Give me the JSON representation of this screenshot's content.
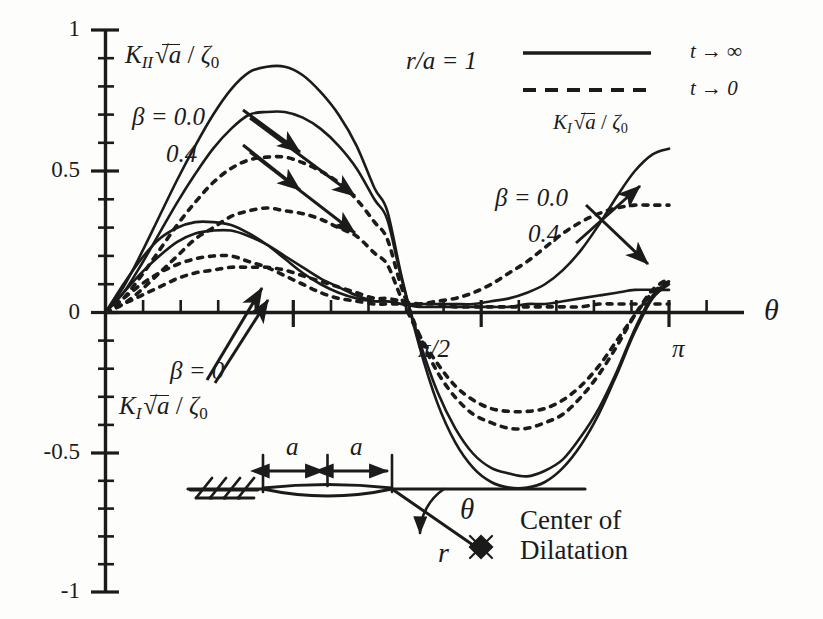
{
  "figure": {
    "background_color": "#fdfdfb",
    "ink_color": "#1b1b1b"
  },
  "axes": {
    "x": {
      "label": "θ",
      "tick_labels": [
        "π/2",
        "π"
      ],
      "tick_values": [
        1.5707963,
        3.1415927
      ],
      "range": [
        0,
        3.4
      ],
      "minor_ticks": true
    },
    "y": {
      "label": "",
      "tick_labels": [
        "1",
        "0.5",
        "0",
        "-0.5",
        "-1"
      ],
      "tick_values": [
        1,
        0.5,
        0,
        -0.5,
        -1
      ],
      "range": [
        -1,
        1
      ],
      "minor_ticks": true
    }
  },
  "annotations": {
    "kii_axis_label": {
      "k": "K",
      "k_sub": "II",
      "radicand": "a",
      "denom": "ζ",
      "denom_sub": "0"
    },
    "ki_axis_label": {
      "k": "K",
      "k_sub": "I",
      "radicand": "a",
      "denom": "ζ",
      "denom_sub": "0"
    },
    "ratio": "r/a = 1",
    "beta_upper_left": {
      "line1": "β = 0.0",
      "line2": "0.4"
    },
    "beta_right": {
      "line1": "β = 0.0",
      "line2": "0.4"
    },
    "beta_lower_left": "β = 0"
  },
  "legend": {
    "entries": [
      {
        "style": "solid",
        "label": "t → ∞"
      },
      {
        "style": "dashed",
        "label": "t → 0"
      }
    ],
    "caption": {
      "k": "K",
      "k_sub": "I",
      "radicand": "a",
      "denom": "ζ",
      "denom_sub": "0"
    }
  },
  "inset": {
    "dim_left_label": "a",
    "dim_right_label": "a",
    "angle_label": "θ",
    "radius_label": "r",
    "caption_line1": "Center of",
    "caption_line2": "Dilatation"
  },
  "chart_data": {
    "type": "line",
    "title": "",
    "xlabel": "θ",
    "ylabel": "K√a / ζ0",
    "xlim": [
      0,
      3.4
    ],
    "ylim": [
      -1,
      1
    ],
    "grid": false,
    "legend_position": "top-right",
    "x": [
      0.0,
      0.1,
      0.2,
      0.3,
      0.4,
      0.5,
      0.6,
      0.7,
      0.8,
      0.9,
      1.0,
      1.1,
      1.2,
      1.3,
      1.4,
      1.5,
      1.5708,
      1.65,
      1.75,
      1.85,
      1.95,
      2.05,
      2.15,
      2.25,
      2.35,
      2.45,
      2.55,
      2.65,
      2.75,
      2.85,
      2.95,
      3.05,
      3.1416
    ],
    "series": [
      {
        "name": "KII, t->inf, beta=0.0",
        "style": "solid",
        "quantity": "KII",
        "values": [
          0.0,
          0.09,
          0.21,
          0.34,
          0.47,
          0.59,
          0.7,
          0.79,
          0.85,
          0.87,
          0.87,
          0.84,
          0.78,
          0.7,
          0.59,
          0.44,
          0.36,
          0.13,
          -0.12,
          -0.32,
          -0.46,
          -0.55,
          -0.6,
          -0.62,
          -0.62,
          -0.6,
          -0.55,
          -0.47,
          -0.36,
          -0.22,
          -0.07,
          0.05,
          0.1
        ]
      },
      {
        "name": "KII, t->inf, beta=0.4",
        "style": "solid",
        "quantity": "KII",
        "values": [
          0.0,
          0.07,
          0.17,
          0.28,
          0.39,
          0.49,
          0.58,
          0.65,
          0.7,
          0.71,
          0.71,
          0.69,
          0.65,
          0.59,
          0.51,
          0.4,
          0.33,
          0.12,
          -0.1,
          -0.28,
          -0.41,
          -0.5,
          -0.55,
          -0.57,
          -0.58,
          -0.56,
          -0.52,
          -0.44,
          -0.34,
          -0.21,
          -0.06,
          0.06,
          0.11
        ]
      },
      {
        "name": "KII, t->0, beta=0.0",
        "style": "dashed",
        "quantity": "KII",
        "values": [
          0.0,
          0.05,
          0.13,
          0.22,
          0.31,
          0.39,
          0.46,
          0.51,
          0.54,
          0.55,
          0.55,
          0.53,
          0.5,
          0.46,
          0.4,
          0.32,
          0.26,
          0.09,
          -0.08,
          -0.21,
          -0.3,
          -0.36,
          -0.39,
          -0.41,
          -0.41,
          -0.39,
          -0.36,
          -0.3,
          -0.22,
          -0.12,
          -0.01,
          0.08,
          0.12
        ]
      },
      {
        "name": "KII, t->0, beta=0.4",
        "style": "dashed",
        "quantity": "KII",
        "values": [
          0.0,
          0.03,
          0.08,
          0.14,
          0.2,
          0.26,
          0.3,
          0.34,
          0.36,
          0.37,
          0.36,
          0.35,
          0.33,
          0.3,
          0.27,
          0.21,
          0.17,
          0.05,
          -0.08,
          -0.18,
          -0.26,
          -0.31,
          -0.34,
          -0.35,
          -0.35,
          -0.34,
          -0.31,
          -0.26,
          -0.19,
          -0.1,
          -0.01,
          0.07,
          0.11
        ]
      },
      {
        "name": "KI, t->inf, beta=0.0",
        "style": "solid",
        "quantity": "KI",
        "values": [
          0.0,
          0.1,
          0.19,
          0.26,
          0.3,
          0.32,
          0.32,
          0.31,
          0.28,
          0.24,
          0.19,
          0.14,
          0.1,
          0.07,
          0.05,
          0.04,
          0.04,
          0.03,
          0.03,
          0.03,
          0.03,
          0.03,
          0.04,
          0.05,
          0.07,
          0.1,
          0.15,
          0.22,
          0.31,
          0.41,
          0.5,
          0.56,
          0.58
        ]
      },
      {
        "name": "KI, t->inf, beta=0.4",
        "style": "solid",
        "quantity": "KI",
        "values": [
          0.0,
          0.07,
          0.14,
          0.2,
          0.25,
          0.28,
          0.29,
          0.29,
          0.27,
          0.24,
          0.2,
          0.16,
          0.12,
          0.09,
          0.06,
          0.04,
          0.04,
          0.03,
          0.02,
          0.02,
          0.02,
          0.02,
          0.02,
          0.02,
          0.03,
          0.03,
          0.04,
          0.05,
          0.06,
          0.07,
          0.08,
          0.08,
          0.08
        ]
      },
      {
        "name": "KI, t->0, beta=0.0",
        "style": "dashed",
        "quantity": "KI",
        "values": [
          0.0,
          0.05,
          0.1,
          0.14,
          0.17,
          0.19,
          0.2,
          0.2,
          0.18,
          0.16,
          0.13,
          0.1,
          0.07,
          0.05,
          0.04,
          0.03,
          0.03,
          0.03,
          0.03,
          0.04,
          0.05,
          0.07,
          0.1,
          0.14,
          0.18,
          0.23,
          0.28,
          0.32,
          0.35,
          0.37,
          0.38,
          0.38,
          0.38
        ]
      },
      {
        "name": "KI, t->0, beta=0.4",
        "style": "dashed",
        "quantity": "KI",
        "values": [
          0.0,
          0.03,
          0.06,
          0.09,
          0.12,
          0.14,
          0.15,
          0.16,
          0.16,
          0.16,
          0.15,
          0.13,
          0.11,
          0.09,
          0.07,
          0.05,
          0.05,
          0.04,
          0.03,
          0.03,
          0.02,
          0.02,
          0.02,
          0.02,
          0.02,
          0.02,
          0.02,
          0.02,
          0.03,
          0.03,
          0.03,
          0.03,
          0.03
        ]
      }
    ]
  }
}
